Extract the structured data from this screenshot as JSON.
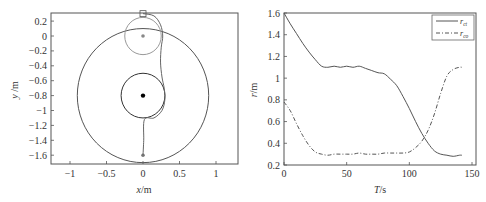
{
  "chart_data": [
    {
      "type": "line",
      "title": "",
      "xlabel": "x/m",
      "ylabel": "y /m",
      "xlim": [
        -1.3,
        1.3
      ],
      "ylim": [
        -1.72,
        0.3
      ],
      "xticks": [
        "-1",
        "-0.5",
        "0",
        "0.5",
        "1"
      ],
      "xtick_values": [
        -1,
        -0.5,
        0,
        0.5,
        1
      ],
      "yticks": [
        "0.2",
        "0",
        "-0.2",
        "-0.4",
        "-0.6",
        "-0.8",
        "-1",
        "-1.2",
        "-1.4",
        "-1.6"
      ],
      "ytick_values": [
        0.2,
        0,
        -0.2,
        -0.4,
        -0.6,
        -0.8,
        -1,
        -1.2,
        -1.4,
        -1.6
      ],
      "grid": false,
      "shapes": [
        {
          "name": "outer-circle",
          "center": [
            0,
            -0.8
          ],
          "radius": 0.9,
          "color": "#555555"
        },
        {
          "name": "inner-circle",
          "center": [
            0,
            -0.8
          ],
          "radius": 0.3,
          "color": "#333333"
        },
        {
          "name": "start-circle",
          "center": [
            0,
            0
          ],
          "radius": 0.25,
          "color": "#999999"
        },
        {
          "name": "center-point",
          "point": [
            0,
            -0.8
          ],
          "color": "#000000"
        },
        {
          "name": "start-point",
          "point": [
            0,
            0
          ],
          "color": "#888888"
        },
        {
          "name": "end-point",
          "point": [
            0,
            -1.6
          ],
          "color": "#777777"
        },
        {
          "name": "start-marker-square",
          "point": [
            0,
            0.3
          ],
          "color": "#555555"
        }
      ],
      "series": [
        {
          "name": "trajectory",
          "x": [
            0.0,
            0.15,
            0.24,
            0.27,
            0.25,
            0.24,
            0.26,
            0.29,
            0.3,
            0.26,
            0.15,
            0.02,
            0.01,
            0.0
          ],
          "y": [
            0.3,
            0.27,
            0.15,
            0.0,
            -0.15,
            -0.35,
            -0.55,
            -0.7,
            -0.85,
            -1.0,
            -1.1,
            -1.12,
            -1.4,
            -1.6
          ]
        }
      ]
    },
    {
      "type": "line",
      "title": "",
      "xlabel": "T/s",
      "ylabel": "r/m",
      "xlim": [
        0,
        150
      ],
      "ylim": [
        0.2,
        1.6
      ],
      "xticks": [
        "0",
        "50",
        "100",
        "150"
      ],
      "xtick_values": [
        0,
        50,
        100,
        150
      ],
      "yticks": [
        "0.2",
        "0.4",
        "0.6",
        "0.8",
        "1",
        "1.2",
        "1.4",
        "1.6"
      ],
      "ytick_values": [
        0.2,
        0.4,
        0.6,
        0.8,
        1.0,
        1.2,
        1.4,
        1.6
      ],
      "grid": false,
      "legend": {
        "position": "upper right",
        "entries": [
          "r_ct",
          "r_co"
        ]
      },
      "x": [
        0,
        5,
        10,
        15,
        20,
        25,
        30,
        35,
        40,
        45,
        50,
        55,
        60,
        65,
        70,
        75,
        80,
        85,
        90,
        95,
        100,
        105,
        110,
        115,
        120,
        125,
        130,
        135,
        140,
        142
      ],
      "series": [
        {
          "name": "r_ct",
          "style": "solid",
          "values": [
            1.6,
            1.5,
            1.41,
            1.32,
            1.24,
            1.17,
            1.11,
            1.1,
            1.11,
            1.1,
            1.11,
            1.1,
            1.11,
            1.09,
            1.07,
            1.05,
            1.04,
            0.99,
            0.93,
            0.83,
            0.72,
            0.6,
            0.49,
            0.4,
            0.33,
            0.3,
            0.29,
            0.28,
            0.29,
            0.29
          ]
        },
        {
          "name": "r_co",
          "style": "dash-dot",
          "values": [
            0.78,
            0.7,
            0.58,
            0.47,
            0.38,
            0.32,
            0.3,
            0.29,
            0.3,
            0.3,
            0.3,
            0.3,
            0.31,
            0.3,
            0.3,
            0.3,
            0.31,
            0.31,
            0.31,
            0.31,
            0.32,
            0.36,
            0.42,
            0.52,
            0.67,
            0.86,
            1.02,
            1.08,
            1.1,
            1.1
          ]
        }
      ]
    }
  ],
  "left_plot": {
    "xlabel_italic": "x",
    "xlabel_unit": "/m",
    "ylabel_italic": "y",
    "ylabel_unit": " /m"
  },
  "right_plot": {
    "xlabel_italic": "T",
    "xlabel_unit": "/s",
    "ylabel_italic": "r",
    "ylabel_unit": "/m",
    "legend": [
      {
        "main": "r",
        "sub": "ct",
        "style": "solid"
      },
      {
        "main": "r",
        "sub": "co",
        "style": "dash-dot"
      }
    ]
  }
}
